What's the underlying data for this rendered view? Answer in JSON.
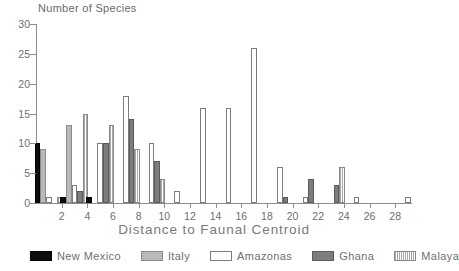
{
  "chart_data": {
    "type": "bar",
    "title": "",
    "xlabel": "Distance to Faunal Centroid",
    "ylabel": "Number of Species",
    "xlim": [
      0,
      29
    ],
    "ylim": [
      0,
      30
    ],
    "grid": false,
    "legend_position": "bottom",
    "y_ticks": [
      0,
      5,
      10,
      15,
      20,
      25,
      30
    ],
    "y_tick_labels": [
      "0",
      "5",
      "10",
      "15",
      "20",
      "25",
      "30"
    ],
    "x_ticks": [
      2,
      4,
      6,
      8,
      10,
      12,
      14,
      16,
      18,
      20,
      22,
      24,
      26,
      28
    ],
    "x_tick_labels": [
      "2",
      "4",
      "6",
      "8",
      "10",
      "12",
      "14",
      "16",
      "18",
      "20",
      "22",
      "24",
      "26",
      "28"
    ],
    "x": [
      1,
      3,
      5,
      7,
      9,
      11,
      13,
      15,
      17,
      19,
      21,
      23,
      25,
      27,
      29
    ],
    "series": [
      {
        "name": "New Mexico",
        "color": "#0d0d0d",
        "fill": "solid-black",
        "values": [
          10,
          1,
          1,
          0,
          0,
          0,
          0,
          0,
          0,
          0,
          0,
          0,
          0,
          0,
          0
        ]
      },
      {
        "name": "Italy",
        "color": "#b9b9b9",
        "fill": "light-gray",
        "values": [
          9,
          13,
          0,
          0,
          0,
          0,
          0,
          0,
          0,
          0,
          0,
          0,
          0,
          0,
          0
        ]
      },
      {
        "name": "Amazonas",
        "color": "#ffffff",
        "fill": "white-outline",
        "values": [
          1,
          3,
          10,
          18,
          10,
          2,
          16,
          16,
          26,
          6,
          1,
          0,
          1,
          0,
          1
        ]
      },
      {
        "name": "Ghana",
        "color": "#7d7d7d",
        "fill": "dark-gray",
        "values": [
          0,
          2,
          10,
          14,
          7,
          0,
          0,
          0,
          0,
          1,
          4,
          3,
          0,
          0,
          0
        ]
      },
      {
        "name": "Malaya",
        "color": "#a9a9a9",
        "fill": "vertical-stripes",
        "values": [
          1,
          15,
          13,
          9,
          4,
          0,
          0,
          0,
          0,
          0,
          0,
          6,
          0,
          0,
          0
        ]
      }
    ]
  },
  "legend": {
    "items": [
      {
        "label": "New Mexico",
        "fill": "solid-black"
      },
      {
        "label": "Italy",
        "fill": "light-gray"
      },
      {
        "label": "Amazonas",
        "fill": "white-outline"
      },
      {
        "label": "Ghana",
        "fill": "dark-gray"
      },
      {
        "label": "Malaya",
        "fill": "vertical-stripes"
      }
    ]
  }
}
